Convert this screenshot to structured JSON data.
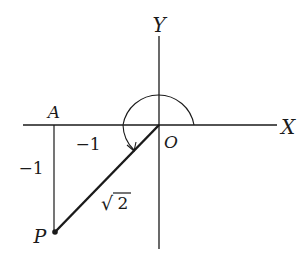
{
  "diagram": {
    "type": "coordinate-plane-angle",
    "axes": {
      "x_label": "X",
      "y_label": "Y",
      "origin_label": "O"
    },
    "points": {
      "A": {
        "label": "A",
        "coords": [
          -1,
          0
        ]
      },
      "P": {
        "label": "P",
        "coords": [
          -1,
          -1
        ]
      }
    },
    "segment_labels": {
      "OA": "−1",
      "AP": "−1",
      "OP_radical": "√",
      "OP_radicand": "2"
    },
    "angle_arc": {
      "from": "positive X axis",
      "direction": "counterclockwise",
      "to": "ray OP",
      "description": "arc with arrowhead from +X axis around to OP (225°)"
    },
    "colors": {
      "ink": "#1a1a1a",
      "background": "#ffffff"
    }
  }
}
